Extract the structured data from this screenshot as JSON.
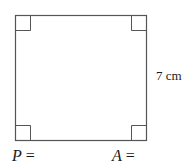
{
  "figure": {
    "shape": "square",
    "right_angle_markers": 4,
    "side_label": "7 cm",
    "stroke_color": "#555555"
  },
  "answers": {
    "perimeter": {
      "variable": "P",
      "equals": "="
    },
    "area": {
      "variable": "A",
      "equals": "="
    }
  }
}
